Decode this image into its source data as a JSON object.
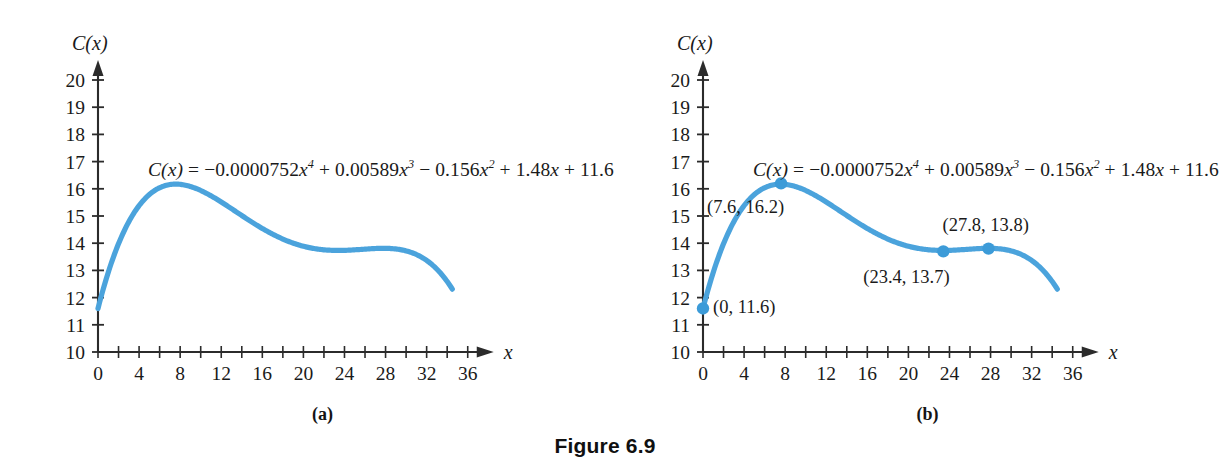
{
  "figure": {
    "caption": "Figure 6.9",
    "panels": [
      {
        "id": "a",
        "caption": "(a)"
      },
      {
        "id": "b",
        "caption": "(b)"
      }
    ]
  },
  "equation": {
    "lhs": "C(x)",
    "eq": "=",
    "t1_coef": "−0.0000752",
    "t1_var": "x",
    "t1_exp": "4",
    "op1": "+",
    "t2_coef": "0.00589",
    "t2_var": "x",
    "t2_exp": "3",
    "op2": "−",
    "t3_coef": "0.156",
    "t3_var": "x",
    "t3_exp": "2",
    "op3": "+",
    "t4_coef": "1.48",
    "t4_var": "x",
    "op4": "+",
    "t5_const": "11.6",
    "plain": "C(x) = −0.0000752x⁴ + 0.00589x³ − 0.156x² + 1.48x + 11.6"
  },
  "axes": {
    "y_name": "C(x)",
    "x_name": "x",
    "y_ticks": [
      "10",
      "11",
      "12",
      "13",
      "14",
      "15",
      "16",
      "17",
      "18",
      "19",
      "20"
    ],
    "x_ticks": [
      "0",
      "4",
      "8",
      "12",
      "16",
      "20",
      "24",
      "28",
      "32",
      "36"
    ],
    "x_minor_step": 2
  },
  "chart_data": {
    "type": "line",
    "title": "Figure 6.9",
    "xlabel": "x",
    "ylabel": "C(x)",
    "xlim": [
      0,
      36
    ],
    "ylim": [
      10,
      20
    ],
    "grid": false,
    "legend": "none",
    "equation": "C(x) = -0.0000752x^4 + 0.00589x^3 - 0.156x^2 + 1.48x + 11.6",
    "coefficients": {
      "x4": -7.52e-05,
      "x3": 0.00589,
      "x2": -0.156,
      "x1": 1.48,
      "x0": 11.6
    },
    "domain_drawn": [
      0,
      34.5
    ],
    "series": [
      {
        "name": "C(x)",
        "color": "#4BA3DC",
        "x": [
          0,
          1,
          2,
          3,
          4,
          5,
          6,
          7,
          7.6,
          8,
          9,
          10,
          11,
          12,
          13,
          14,
          15,
          16,
          17,
          18,
          19,
          20,
          21,
          22,
          23,
          23.4,
          24,
          25,
          26,
          27,
          27.8,
          28,
          29,
          30,
          31,
          32,
          33,
          34,
          34.5
        ],
        "y": [
          11.6,
          12.93,
          13.99,
          14.81,
          15.42,
          15.85,
          16.12,
          16.26,
          16.29,
          16.29,
          16.22,
          16.08,
          15.9,
          15.69,
          15.47,
          15.24,
          15.02,
          14.81,
          14.62,
          14.45,
          14.3,
          14.18,
          14.08,
          14.0,
          13.94,
          13.92,
          13.89,
          13.85,
          13.82,
          13.79,
          13.78,
          13.77,
          13.74,
          13.68,
          13.58,
          13.43,
          13.2,
          12.89,
          12.7
        ]
      }
    ],
    "annotations": [
      {
        "panel": "b",
        "x": 0,
        "y": 11.6,
        "label": "(0, 11.6)",
        "kind": "endpoint"
      },
      {
        "panel": "b",
        "x": 7.6,
        "y": 16.2,
        "label": "(7.6, 16.2)",
        "kind": "local-maximum"
      },
      {
        "panel": "b",
        "x": 23.4,
        "y": 13.7,
        "label": "(23.4, 13.7)",
        "kind": "local-minimum"
      },
      {
        "panel": "b",
        "x": 27.8,
        "y": 13.8,
        "label": "(27.8, 13.8)",
        "kind": "local-maximum"
      }
    ]
  },
  "colors": {
    "curve": "#4BA3DC",
    "point": "#3C9BD8",
    "axis": "#2b2b2b",
    "text": "#1a1a1a",
    "background": "#ffffff"
  }
}
